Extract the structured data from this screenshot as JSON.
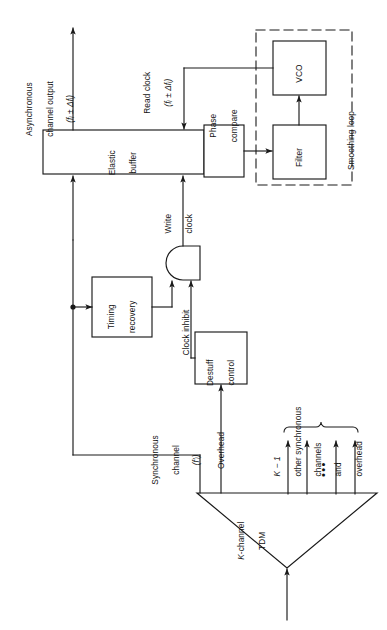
{
  "figure": {
    "type": "block-diagram",
    "orientation": "rotated-90-ccw",
    "background_color": "#ffffff",
    "line_color": "#1a1a1a"
  },
  "blocks": {
    "elastic_buffer": {
      "line1": "Elastic",
      "line2": "buffer"
    },
    "phase_compare": {
      "line1": "Phase",
      "line2": "compare"
    },
    "vco": {
      "label": "VCO"
    },
    "filter": {
      "label": "Filter"
    },
    "timing_recovery": {
      "line1": "Timing",
      "line2": "recovery"
    },
    "destuff_control": {
      "line1": "Destuff",
      "line2": "control"
    },
    "tdm": {
      "line1": "K-channel",
      "line2": "TDM"
    }
  },
  "groups": {
    "smoothing_loop": {
      "label": "Smoothing loop",
      "style": "dashed"
    }
  },
  "signals": {
    "async_output": {
      "line1": "Asynchronous",
      "line2": "channel output",
      "line3": "(fᵢ ± Δfᵢ)"
    },
    "read_clock": {
      "line1": "Read clock",
      "line2": "(fᵢ ± Δfᵢ)"
    },
    "write_clock": {
      "line1": "Write",
      "line2": "clock"
    },
    "clock_inhibit": {
      "label": "Clock inhibit"
    },
    "sync_channel": {
      "line1": "Synchronous",
      "line2": "channel",
      "line3": "(f′ᵢ)"
    },
    "overhead": {
      "label": "Overhead"
    },
    "other_channels": {
      "line1": "K − 1",
      "line2": "other synchronous",
      "line3": "channels",
      "line4": "and",
      "line5": "overhead"
    },
    "ellipsis": {
      "label": "•••"
    }
  }
}
